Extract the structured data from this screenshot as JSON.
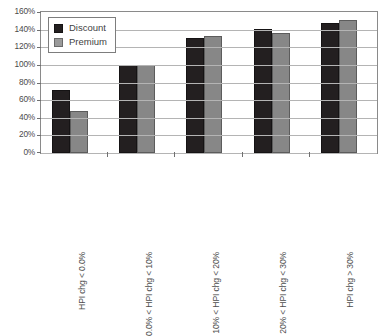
{
  "chart_data": {
    "type": "bar",
    "title": "",
    "xlabel": "",
    "ylabel": "",
    "ylim": [
      0,
      160
    ],
    "ytick_labels": [
      "160%",
      "140%",
      "120%",
      "100%",
      "80%",
      "60%",
      "40%",
      "20%",
      "0%"
    ],
    "ytick_values": [
      160,
      140,
      120,
      100,
      80,
      60,
      40,
      20,
      0
    ],
    "grid": true,
    "legend_position": "top-left",
    "categories": [
      "HPI chg < 0.0%",
      "0.0% < HPI chg < 10%",
      "10% < HPI chg < 20%",
      "20% < HPI chg < 30%",
      "HPI chg > 30%"
    ],
    "series": [
      {
        "name": "Discount",
        "color": "#231f20",
        "values": [
          71,
          100,
          130,
          141,
          147
        ]
      },
      {
        "name": "Premium",
        "color": "#878787",
        "values": [
          48,
          100,
          133,
          136,
          151
        ]
      }
    ]
  },
  "legend": {
    "items": [
      {
        "label": "Discount"
      },
      {
        "label": "Premium"
      }
    ]
  }
}
